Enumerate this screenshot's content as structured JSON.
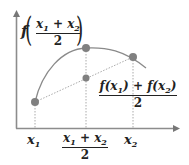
{
  "diagram": {
    "type": "concave-function-jensen-illustration",
    "colors": {
      "axis": "#888888",
      "curve": "#8a8a8a",
      "points": "#808080",
      "dotted": "#aaaaaa",
      "text": "#222222"
    },
    "points": [
      {
        "id": "left",
        "x": 35,
        "y": 102,
        "label": "(x1, f(x1))"
      },
      {
        "id": "top",
        "x": 86,
        "y": 48,
        "label": "(mid, f(mid))"
      },
      {
        "id": "right",
        "x": 133,
        "y": 57,
        "label": "(x2, f(x2))"
      },
      {
        "id": "chord-mid",
        "x": 86,
        "y": 78,
        "label": "chord midpoint"
      }
    ],
    "labels": {
      "f_of_mean": {
        "f": "f",
        "num_a": "x",
        "sub_a": "1",
        "plus": " + ",
        "num_b": "x",
        "sub_b": "2",
        "den": "2"
      },
      "mean_of_f": {
        "f1": "f(x",
        "sub1": "1",
        "close1": ")",
        "plus": " + ",
        "f2": "f(x",
        "sub2": "2",
        "close2": ")",
        "den": "2"
      },
      "x1": {
        "x": "x",
        "sub": "1"
      },
      "xmid": {
        "num_a": "x",
        "sub_a": "1",
        "plus": " + ",
        "num_b": "x",
        "sub_b": "2",
        "den": "2"
      },
      "x2": {
        "x": "x",
        "sub": "2"
      }
    }
  }
}
